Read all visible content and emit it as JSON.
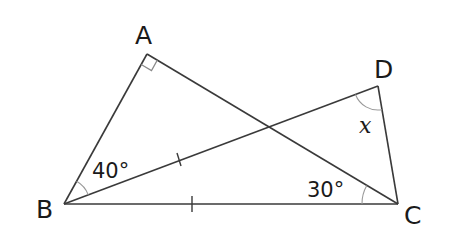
{
  "diagram": {
    "type": "geometry",
    "vertices": {
      "A": {
        "label": "A",
        "x": 147,
        "y": 54
      },
      "B": {
        "label": "B",
        "x": 64,
        "y": 204
      },
      "C": {
        "label": "C",
        "x": 398,
        "y": 204
      },
      "D": {
        "label": "D",
        "x": 378,
        "y": 86
      }
    },
    "segments": [
      "AB",
      "AC",
      "BC",
      "BD",
      "DC"
    ],
    "right_angle_at": "A",
    "equal_length_marks": [
      "BD",
      "BC"
    ],
    "angles": {
      "ABD": "40°",
      "ACB": "30°",
      "BDC": "x"
    },
    "colors": {
      "line": "#3a3a3a",
      "arc": "#9a9a9a",
      "text": "#1a1a1a",
      "background": "#ffffff"
    }
  }
}
